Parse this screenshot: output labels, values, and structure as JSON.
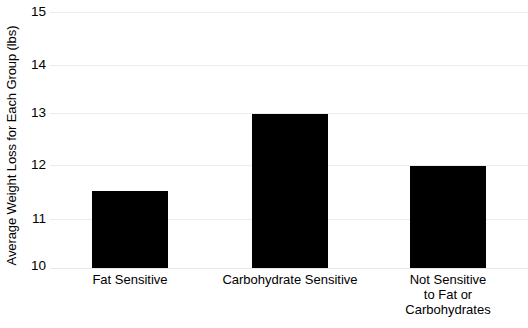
{
  "chart_data": {
    "type": "bar",
    "title": "",
    "xlabel": "",
    "ylabel": "Average Weight Loss for Each Group (lbs)",
    "categories": [
      "Fat Sensitive",
      "Carbohydrate Sensitive",
      "Not Sensitive to Fat or Carbohydrates"
    ],
    "category_lines": [
      [
        "Fat Sensitive"
      ],
      [
        "Carbohydrate Sensitive"
      ],
      [
        "Not Sensitive",
        "to Fat or",
        "Carbohydrates"
      ]
    ],
    "values": [
      11.5,
      13,
      12
    ],
    "ylim": [
      10,
      15
    ],
    "yticks": [
      10,
      11,
      12,
      13,
      14,
      15
    ],
    "ytick_labels": [
      "10",
      "11",
      "12",
      "13",
      "14",
      "15"
    ],
    "grid": true,
    "legend": null,
    "bar_color": "#000000",
    "grid_color": "#ededed",
    "background_color": "#ffffff"
  }
}
